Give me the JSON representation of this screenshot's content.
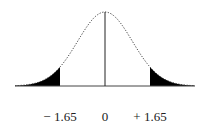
{
  "diagram": {
    "type": "normal-distribution-two-tailed",
    "tick_labels": {
      "left": "− 1.65",
      "center": "0",
      "right": "+ 1.65"
    },
    "critical_value": 1.65,
    "mean": 0,
    "shaded_regions": [
      "left-tail",
      "right-tail"
    ],
    "colors": {
      "shade": "#000000",
      "curve": "#333333",
      "axis": "#444444"
    }
  }
}
